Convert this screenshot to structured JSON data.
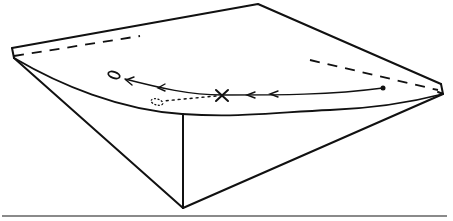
{
  "figure": {
    "colors": {
      "line": "#111111",
      "rule": "#8a8a8a",
      "background": "#ffffff"
    },
    "trajectory": {
      "start_marker": "dot",
      "intermediate_marker": "x-mark",
      "end_marker": "open-ellipse",
      "branch_marker": "hatched-ellipse",
      "arrow_direction": "right-to-left",
      "arrow_count": 3
    },
    "labels": []
  }
}
